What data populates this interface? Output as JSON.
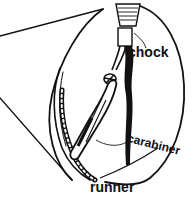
{
  "diagram": {
    "type": "illustration",
    "colors": {
      "ink": "#111111",
      "background": "#ffffff"
    },
    "labels": {
      "chock": "chock",
      "carabiner": "carabiner",
      "runner": "runner"
    }
  }
}
